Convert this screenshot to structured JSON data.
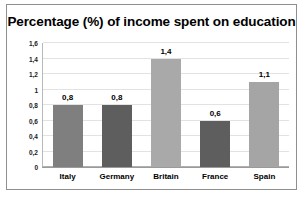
{
  "chart_data": {
    "type": "bar",
    "title": "Percentage (%) of income spent on education",
    "xlabel": "",
    "ylabel": "",
    "categories": [
      "Italy",
      "Germany",
      "Britain",
      "France",
      "Spain"
    ],
    "values": [
      0.8,
      0.8,
      1.4,
      0.6,
      1.1
    ],
    "value_labels": [
      "0,8",
      "0,8",
      "1,4",
      "0,6",
      "1,1"
    ],
    "bar_colors": [
      "#7f7f7f",
      "#5e5e5e",
      "#a9a9a9",
      "#5e5e5e",
      "#a5a5a5"
    ],
    "ylim": [
      0,
      1.6
    ],
    "ytick_values": [
      0,
      0.2,
      0.4,
      0.6,
      0.8,
      1.0,
      1.2,
      1.4,
      1.6
    ],
    "ytick_labels": [
      "0",
      "0,2",
      "0,4",
      "0,6",
      "0,8",
      "1",
      "1,2",
      "1,4",
      "1,6"
    ],
    "grid": true,
    "legend": "none",
    "decimal_separator": ","
  }
}
